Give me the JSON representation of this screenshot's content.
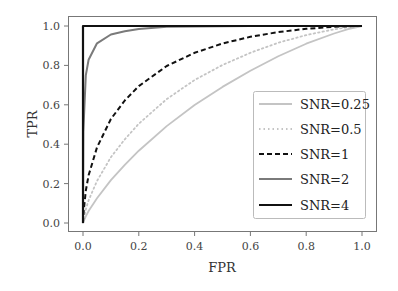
{
  "chart_data": {
    "type": "line",
    "title": "",
    "xlabel": "FPR",
    "ylabel": "TPR",
    "xlim": [
      0,
      1
    ],
    "ylim": [
      0,
      1
    ],
    "grid": false,
    "legend_position": "lower right",
    "x_ticks": [
      "0.0",
      "0.2",
      "0.4",
      "0.6",
      "0.8",
      "1.0"
    ],
    "y_ticks": [
      "0.0",
      "0.2",
      "0.4",
      "0.6",
      "0.8",
      "1.0"
    ],
    "x": [
      0,
      0.001,
      0.01,
      0.02,
      0.05,
      0.1,
      0.15,
      0.2,
      0.3,
      0.4,
      0.5,
      0.6,
      0.7,
      0.8,
      0.9,
      0.95,
      1.0
    ],
    "series": [
      {
        "name": "SNR=0.25",
        "color": "#c4c4c4",
        "style": "solid",
        "width": 1.8,
        "values": [
          0,
          0.005,
          0.034,
          0.061,
          0.126,
          0.218,
          0.295,
          0.367,
          0.492,
          0.599,
          0.691,
          0.773,
          0.846,
          0.91,
          0.962,
          0.984,
          1.0
        ]
      },
      {
        "name": "SNR=0.5",
        "color": "#c4c4c4",
        "style": "dotted",
        "width": 1.8,
        "values": [
          0,
          0.013,
          0.069,
          0.115,
          0.213,
          0.334,
          0.425,
          0.504,
          0.629,
          0.726,
          0.802,
          0.864,
          0.915,
          0.954,
          0.983,
          0.994,
          1.0
        ]
      },
      {
        "name": "SNR=1",
        "color": "#111111",
        "style": "dashed",
        "width": 2,
        "values": [
          0,
          0.041,
          0.164,
          0.242,
          0.384,
          0.528,
          0.622,
          0.695,
          0.797,
          0.864,
          0.911,
          0.945,
          0.969,
          0.986,
          0.996,
          0.999,
          1.0
        ]
      },
      {
        "name": "SNR=2",
        "color": "#7a7a7a",
        "style": "solid",
        "width": 2,
        "values": [
          0,
          0.464,
          0.749,
          0.829,
          0.912,
          0.957,
          0.973,
          0.985,
          0.996,
          0.998,
          0.999,
          1.0,
          1.0,
          1.0,
          1.0,
          1.0,
          1.0
        ]
      },
      {
        "name": "SNR=4",
        "color": "#111111",
        "style": "solid",
        "width": 2.2,
        "values": [
          0,
          0.999,
          1.0,
          1.0,
          1.0,
          1.0,
          1.0,
          1.0,
          1.0,
          1.0,
          1.0,
          1.0,
          1.0,
          1.0,
          1.0,
          1.0,
          1.0
        ]
      }
    ]
  }
}
